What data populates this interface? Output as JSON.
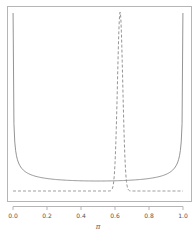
{
  "chart_data": {
    "type": "line",
    "title": "",
    "xlabel": "π",
    "ylabel": "",
    "xlim": [
      0.0,
      1.0
    ],
    "x_ticks": [
      0.0,
      0.2,
      0.4,
      0.6,
      0.8,
      1.0
    ],
    "x_tick_labels": [
      "0.0",
      "0.2",
      "0.4",
      "0.6",
      "0.8",
      "1.0"
    ],
    "y_ticks_shown": false,
    "grid": false,
    "legend": null,
    "series": [
      {
        "name": "prior",
        "style": "solid",
        "color": "#888888",
        "description": "U-shaped Beta(0.5, 0.5) density",
        "x": [
          0.005,
          0.01,
          0.02,
          0.05,
          0.1,
          0.2,
          0.3,
          0.4,
          0.5,
          0.6,
          0.7,
          0.8,
          0.9,
          0.95,
          0.98,
          0.99,
          0.995
        ],
        "y": [
          4.52,
          3.2,
          2.27,
          1.46,
          1.06,
          0.8,
          0.69,
          0.65,
          0.64,
          0.65,
          0.69,
          0.8,
          1.06,
          1.46,
          2.27,
          3.2,
          4.52
        ]
      },
      {
        "name": "posterior",
        "style": "dashed",
        "color": "#888888",
        "description": "Sharply peaked density centered near π ≈ 0.63",
        "x": [
          0.0,
          0.55,
          0.58,
          0.59,
          0.6,
          0.61,
          0.62,
          0.63,
          0.64,
          0.65,
          0.66,
          0.67,
          0.68,
          0.71,
          1.0
        ],
        "y": [
          0.0,
          0.0,
          0.05,
          0.4,
          1.6,
          4.6,
          8.9,
          11.4,
          9.5,
          5.3,
          2.0,
          0.5,
          0.08,
          0.0,
          0.0
        ]
      }
    ],
    "peak": {
      "x": 0.63,
      "y": 11.4
    }
  }
}
